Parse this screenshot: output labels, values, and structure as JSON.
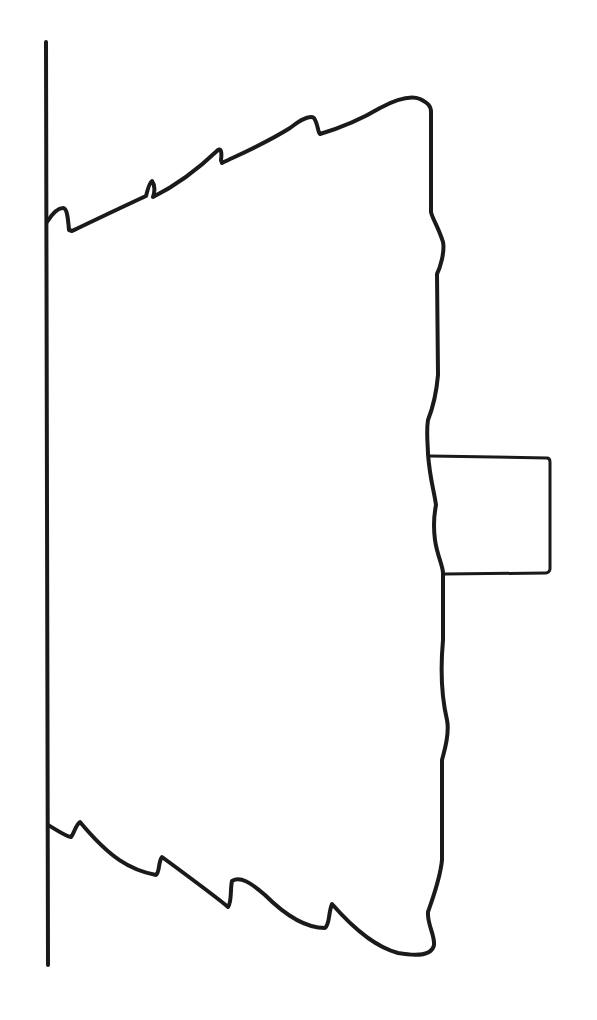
{
  "canvas": {
    "width": 597,
    "height": 1020,
    "background": "#ffffff"
  },
  "stroke": {
    "color": "#1a1a1a",
    "width": 4,
    "thin_width": 3
  },
  "diagram": {
    "wall_line": {
      "x1": 46,
      "y1": 42,
      "x2": 48,
      "y2": 965
    },
    "body_outline": "M 47 222 C 52 214, 58 208, 63 208 C 67 208, 68 218, 69 230 L 72 231 C 95 220, 120 208, 146 196 C 148 188, 150 182, 152 181 C 155 185, 155 192, 153 197 C 175 186, 195 172, 218 150 C 221 148, 222 152, 221 160 L 222 163 C 245 152, 268 142, 290 128 C 300 120, 310 115, 314 118 C 318 124, 318 133, 320 134 C 340 128, 360 120, 380 108 C 395 100, 410 95, 420 99 C 428 103, 431 106, 431 112 L 431 212 C 432 218, 438 226, 443 242 C 445 252, 440 268, 437 274 L 438 375 C 436 398, 432 410, 428 420 C 426 432, 428 446, 428 454 C 430 480, 434 490, 436 505 C 434 515, 433 525, 435 540 C 437 555, 443 566, 443 573 L 443 640 C 441 662, 440 690, 447 720 C 450 735, 444 752, 442 760 L 442 860 C 440 880, 432 900, 428 912 C 427 924, 435 935, 434 945 C 432 955, 420 957, 398 953 C 380 948, 360 936, 332 904 C 328 914, 330 924, 325 928 C 310 928, 290 920, 265 895 C 250 882, 240 876, 232 881 C 230 890, 232 902, 228 907 C 220 900, 200 885, 162 857 C 158 862, 160 872, 156 875 C 130 870, 110 858, 80 822 C 75 826, 74 834, 71 837 C 65 836, 57 830, 48 825",
    "tab_rectangle": "M 430 456 L 547 458 C 549 458, 550 460, 550 462 L 550 569 C 550 571, 548 573, 546 573 L 445 574"
  }
}
